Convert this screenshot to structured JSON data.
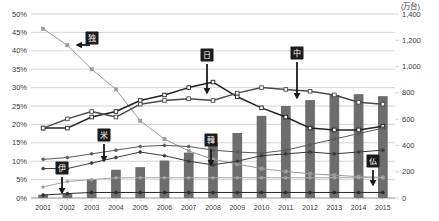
{
  "chart_data": {
    "type": "bar",
    "title": "",
    "xlabel": "",
    "ylabel": "",
    "y_left": {
      "ticks": [
        "0%",
        "5%",
        "10%",
        "15%",
        "20%",
        "25%",
        "30%",
        "35%",
        "40%",
        "45%",
        "50%"
      ],
      "min": 0,
      "max": 50,
      "step": 5,
      "unit": "%"
    },
    "y_right": {
      "unit_label": "(万台)",
      "ticks": [
        "0",
        "200",
        "400",
        "600",
        "800",
        "1,000",
        "1,200",
        "1,400"
      ],
      "min": 0,
      "max": 1400,
      "step": 200
    },
    "categories": [
      "2001",
      "2002",
      "2003",
      "2004",
      "2005",
      "2006",
      "2007",
      "2008",
      "2009",
      "2010",
      "2011",
      "2012",
      "2013",
      "2014",
      "2015"
    ],
    "grid": true,
    "legend_position": "none",
    "bar_series": {
      "name": "bars",
      "axis": "right",
      "color": "#6d6d6d",
      "unit": "万台",
      "values": [
        25,
        35,
        145,
        215,
        235,
        285,
        345,
        420,
        495,
        625,
        700,
        745,
        785,
        790,
        775
      ]
    },
    "series": [
      {
        "name": "独",
        "axis": "left",
        "color": "#9a9a9a",
        "marker": "square",
        "values": [
          46.0,
          41.5,
          35.0,
          29.5,
          21.0,
          16.0,
          12.8,
          10.5,
          9.2,
          8.0,
          7.2,
          6.6,
          6.2,
          5.8,
          5.6
        ]
      },
      {
        "name": "日",
        "axis": "left",
        "color": "#222222",
        "marker": "open-square",
        "values": [
          19.0,
          19.0,
          22.0,
          23.5,
          26.5,
          28.0,
          30.0,
          31.5,
          27.5,
          24.5,
          22.0,
          19.0,
          18.5,
          18.5,
          19.5
        ]
      },
      {
        "name": "中",
        "axis": "left",
        "color": "#4a4a4a",
        "marker": "open-square",
        "values": [
          19.0,
          21.5,
          23.5,
          22.0,
          25.5,
          26.5,
          27.0,
          26.5,
          28.5,
          30.0,
          29.5,
          29.0,
          28.0,
          26.0,
          25.5
        ]
      },
      {
        "name": "米",
        "axis": "left",
        "color": "#5a5a5a",
        "marker": "dot",
        "values": [
          10.5,
          11.0,
          12.0,
          13.0,
          14.0,
          14.3,
          14.0,
          13.0,
          12.5,
          12.2,
          13.0,
          14.5,
          16.0,
          17.5,
          19.0
        ]
      },
      {
        "name": "韓",
        "axis": "left",
        "color": "#3a3a3a",
        "marker": "dot",
        "values": [
          8.0,
          8.0,
          9.5,
          11.0,
          12.5,
          11.5,
          10.0,
          9.0,
          10.0,
          11.5,
          12.0,
          12.5,
          12.0,
          12.5,
          13.0
        ]
      },
      {
        "name": "仏",
        "axis": "left",
        "color": "#a5a5a5",
        "marker": "dot",
        "values": [
          3.0,
          4.5,
          5.0,
          5.5,
          5.5,
          5.5,
          5.5,
          5.5,
          5.5,
          5.5,
          5.5,
          5.5,
          5.5,
          5.5,
          5.5
        ]
      },
      {
        "name": "伊",
        "axis": "left",
        "color": "#2b2b2b",
        "marker": "dot",
        "values": [
          0.8,
          1.2,
          1.5,
          1.5,
          1.5,
          1.5,
          1.5,
          1.5,
          1.5,
          1.5,
          1.5,
          1.5,
          1.5,
          1.5,
          1.5
        ]
      }
    ],
    "annotations": [
      {
        "label": "独",
        "x": 2003,
        "arrow": "left"
      },
      {
        "label": "日",
        "x": 2008,
        "arrow": "down"
      },
      {
        "label": "中",
        "x": 2011,
        "arrow": "down"
      },
      {
        "label": "米",
        "x": 2004,
        "arrow": "down"
      },
      {
        "label": "韓",
        "x": 2008,
        "arrow": "down"
      },
      {
        "label": "仏",
        "x": 2014,
        "arrow": "down"
      },
      {
        "label": "伊",
        "x": 2002,
        "arrow": "down"
      }
    ]
  }
}
